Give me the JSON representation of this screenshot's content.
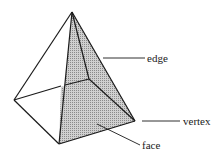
{
  "diagram": {
    "type": "square-based pyramid",
    "labels": {
      "edge": "edge",
      "vertex": "vertex",
      "face": "face"
    },
    "colors": {
      "stroke": "#1a1a1a",
      "face_fill": "#b8b8b8",
      "background": "#ffffff"
    }
  }
}
